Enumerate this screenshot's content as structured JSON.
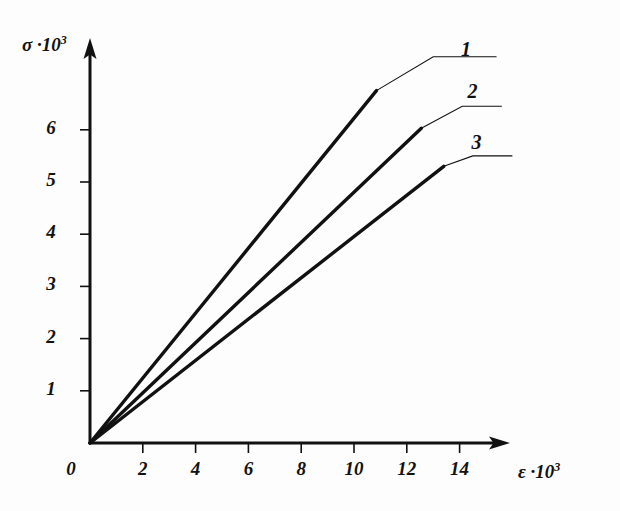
{
  "chart_data": {
    "type": "line",
    "title": "",
    "subtitle": "",
    "xlabel": "ε ·10³",
    "ylabel": "σ ·10³",
    "xlim": [
      0,
      15.5
    ],
    "ylim": [
      0,
      7.6
    ],
    "xticks": [
      0,
      2,
      4,
      6,
      8,
      10,
      12,
      14
    ],
    "yticks": [
      1,
      2,
      3,
      4,
      5,
      6
    ],
    "xtick_labels": [
      "0",
      "2",
      "4",
      "6",
      "8",
      "10",
      "12",
      "14"
    ],
    "ytick_labels": [
      "1",
      "2",
      "3",
      "4",
      "5",
      "6"
    ],
    "grid": false,
    "legend_position": "inline-leader-labels",
    "axis_style": "arrow-ended",
    "series": [
      {
        "name": "1",
        "label": "1",
        "x": [
          0,
          10.85
        ],
        "y": [
          0,
          6.75
        ],
        "slope": 0.622,
        "leader": {
          "x": [
            10.85,
            13.0,
            15.4
          ],
          "y": [
            6.75,
            7.4,
            7.4
          ]
        },
        "label_pos": {
          "x": 14.05,
          "y": 7.75
        }
      },
      {
        "name": "2",
        "label": "2",
        "x": [
          0,
          12.55
        ],
        "y": [
          0,
          6.03
        ],
        "slope": 0.481,
        "leader": {
          "x": [
            12.55,
            14.1,
            15.6
          ],
          "y": [
            6.03,
            6.45,
            6.45
          ]
        },
        "label_pos": {
          "x": 14.3,
          "y": 6.95
        }
      },
      {
        "name": "3",
        "label": "3",
        "x": [
          0,
          13.4
        ],
        "y": [
          0,
          5.3
        ],
        "slope": 0.396,
        "leader": {
          "x": [
            13.4,
            14.5,
            16.0
          ],
          "y": [
            5.3,
            5.5,
            5.5
          ]
        },
        "label_pos": {
          "x": 14.45,
          "y": 5.98
        }
      }
    ],
    "annotations": [
      {
        "name": "origin-label",
        "text": "0",
        "x": -0.55,
        "y": -0.62
      }
    ]
  }
}
